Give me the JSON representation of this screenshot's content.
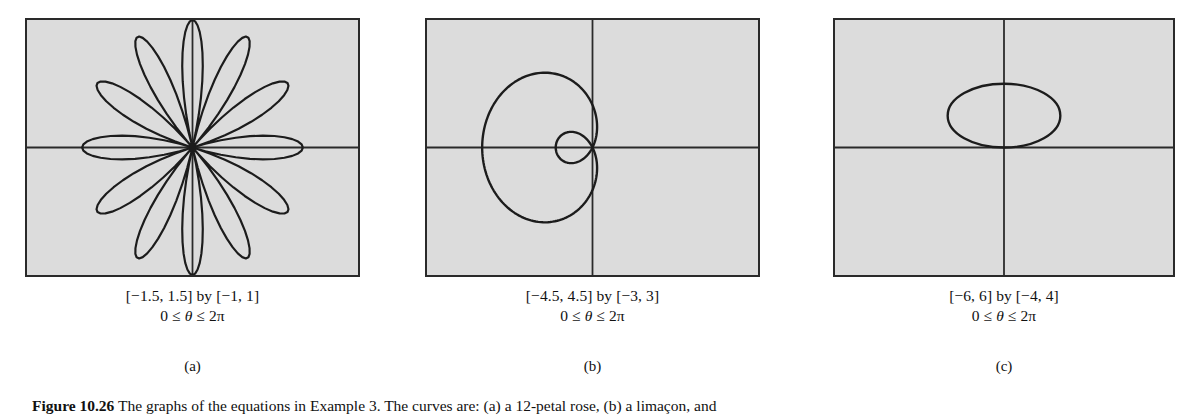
{
  "page": {
    "background_color": "#ffffff",
    "panel_fill_color": "#dcdcdc",
    "ink_color": "#2a2a2a"
  },
  "figure_caption": {
    "number": "Figure 10.26",
    "text": "The graphs of the equations in Example 3. The curves are: (a) a 12-petal rose, (b) a limaçon, and"
  },
  "panels": [
    {
      "label": "(a)",
      "range_line1": "[−1.5, 1.5] by [−1, 1]",
      "range_line2_prefix": "0 ≤ ",
      "range_line2_theta": "θ",
      "range_line2_suffix": " ≤ 2π",
      "curve_name": "twelve-petal-rose"
    },
    {
      "label": "(b)",
      "range_line1": "[−4.5, 4.5] by [−3, 3]",
      "range_line2_prefix": "0 ≤ ",
      "range_line2_theta": "θ",
      "range_line2_suffix": " ≤ 2π",
      "curve_name": "limacon-with-inner-loop"
    },
    {
      "label": "(c)",
      "range_line1": "[−6, 6] by [−4, 4]",
      "range_line2_prefix": "0 ≤ ",
      "range_line2_theta": "θ",
      "range_line2_suffix": " ≤ 2π",
      "curve_name": "circle-tangent-to-x-axis"
    }
  ],
  "chart_data": [
    {
      "type": "line",
      "title": "(a) 12-petal rose",
      "polar_equation": "r = cos(6θ)",
      "petals": 12,
      "xlim": [
        -1.5,
        1.5
      ],
      "ylim": [
        -1,
        1
      ],
      "theta_range": [
        0,
        6.283185307179586
      ],
      "grid": false,
      "axes": "centered-crosshair",
      "legend": "none"
    },
    {
      "type": "line",
      "title": "(b) limaçon with inner loop",
      "polar_equation": "r = 1 − 2 cos(θ)",
      "inner_loop": true,
      "opens": "left",
      "xlim": [
        -4.5,
        4.5
      ],
      "ylim": [
        -3,
        3
      ],
      "theta_range": [
        0,
        6.283185307179586
      ],
      "grid": false,
      "axes": "centered-crosshair",
      "legend": "none"
    },
    {
      "type": "line",
      "title": "(c) circle",
      "polar_equation": "r = 2 sin(θ)",
      "center": [
        0,
        1
      ],
      "radius": 1,
      "xlim": [
        -6,
        6
      ],
      "ylim": [
        -4,
        4
      ],
      "theta_range": [
        0,
        6.283185307179586
      ],
      "grid": false,
      "axes": "centered-crosshair",
      "legend": "none"
    }
  ]
}
